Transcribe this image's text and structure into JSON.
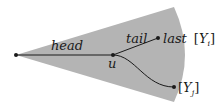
{
  "diagram": {
    "colors": {
      "wedge_fill": "#b4b4b4",
      "line": "#1a1a1a",
      "node": "#1a1a1a",
      "background": "#ffffff"
    },
    "wedge": {
      "apex": [
        16,
        55
      ],
      "top": [
        174,
        7
      ],
      "bottom": [
        174,
        102
      ]
    },
    "nodes": [
      {
        "id": "root",
        "pos": [
          16,
          55
        ]
      },
      {
        "id": "u",
        "pos": [
          113,
          55
        ],
        "label": "u"
      },
      {
        "id": "last",
        "pos": [
          158,
          38
        ]
      },
      {
        "id": "yj",
        "pos": [
          174,
          87
        ]
      }
    ],
    "edges": [
      {
        "from": "root",
        "to": "u",
        "label": "head"
      },
      {
        "from": "u",
        "to": "last",
        "label": "tail"
      },
      {
        "from": "u",
        "to": "yj",
        "label": ""
      }
    ],
    "labels": {
      "head": "head",
      "tail": "tail",
      "u": "u",
      "last_prefix": "last",
      "last_bracket_open": "[",
      "last_var": "Y",
      "last_sub": "i",
      "last_bracket_close": "]",
      "yj_bracket_open": "[",
      "yj_var": "Y",
      "yj_sub": "j",
      "yj_bracket_close": "]"
    }
  }
}
